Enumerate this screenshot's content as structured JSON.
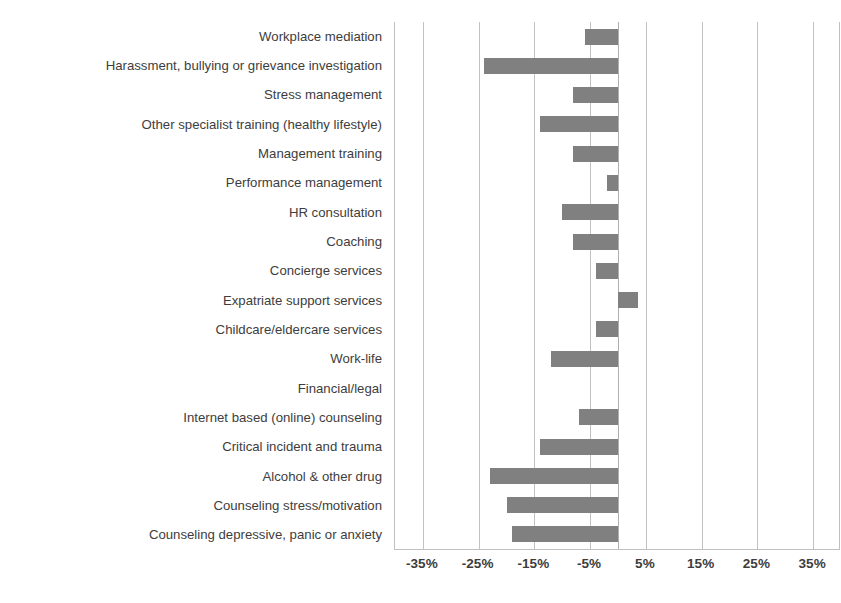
{
  "chart_data": {
    "type": "bar",
    "orientation": "horizontal",
    "title": "",
    "xlabel": "",
    "ylabel": "",
    "xlim": [
      -40,
      40
    ],
    "grid": true,
    "legend": "none",
    "bar_color": "#808080",
    "gridline_color": "#c2c2c2",
    "xticks": [
      "-35%",
      "-25%",
      "-15%",
      "-5%",
      "5%",
      "15%",
      "25%",
      "35%"
    ],
    "xtick_values": [
      -35,
      -25,
      -15,
      -5,
      5,
      15,
      25,
      35
    ],
    "categories": [
      "Workplace mediation",
      "Harassment, bullying or grievance investigation",
      "Stress management",
      "Other specialist training (healthy lifestyle)",
      "Management training",
      "Performance management",
      "HR consultation",
      "Coaching",
      "Concierge services",
      "Expatriate support services",
      "Childcare/eldercare services",
      "Work-life",
      "Financial/legal",
      "Internet based (online) counseling",
      "Critical incident and trauma",
      "Alcohol & other drug",
      "Counseling stress/motivation",
      "Counseling depressive, panic or anxiety"
    ],
    "values": [
      -6,
      -24,
      -8,
      -14,
      -8,
      -2,
      -10,
      -8,
      -4,
      3.5,
      -4,
      -12,
      0,
      -7,
      -14,
      -23,
      -20,
      -19
    ]
  }
}
